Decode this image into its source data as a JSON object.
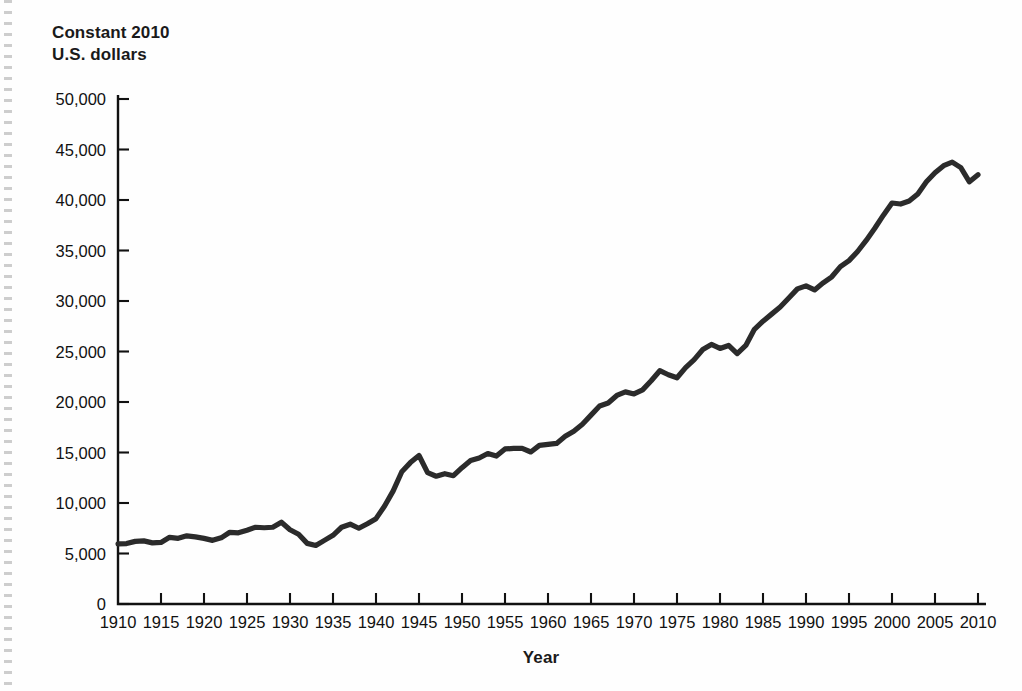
{
  "chart_data": {
    "type": "line",
    "title": "",
    "ylabel": "Constant 2010\nU.S. dollars",
    "xlabel": "Year",
    "xlim": [
      1910,
      2010
    ],
    "ylim": [
      0,
      50000
    ],
    "grid": false,
    "legend": "none",
    "yticks": [
      0,
      5000,
      10000,
      15000,
      20000,
      25000,
      30000,
      35000,
      40000,
      45000,
      50000
    ],
    "ytick_labels": [
      "0",
      "5,000",
      "10,000",
      "15,000",
      "20,000",
      "25,000",
      "30,000",
      "35,000",
      "40,000",
      "45,000",
      "50,000"
    ],
    "xticks": [
      1910,
      1915,
      1920,
      1925,
      1930,
      1935,
      1940,
      1945,
      1950,
      1955,
      1960,
      1965,
      1970,
      1975,
      1980,
      1985,
      1990,
      1995,
      2000,
      2005,
      2010
    ],
    "xtick_labels": [
      "1910",
      "1915",
      "1920",
      "1925",
      "1930",
      "1935",
      "1940",
      "1945",
      "1950",
      "1955",
      "1960",
      "1965",
      "1970",
      "1975",
      "1980",
      "1985",
      "1990",
      "1995",
      "2000",
      "2005",
      "2010"
    ],
    "line_color": "#2b2b2b",
    "series": [
      {
        "name": "Constant 2010 U.S. dollars",
        "x": [
          1910,
          1911,
          1912,
          1913,
          1914,
          1915,
          1916,
          1917,
          1918,
          1919,
          1920,
          1921,
          1922,
          1923,
          1924,
          1925,
          1926,
          1927,
          1928,
          1929,
          1930,
          1931,
          1932,
          1933,
          1934,
          1935,
          1936,
          1937,
          1938,
          1939,
          1940,
          1941,
          1942,
          1943,
          1944,
          1945,
          1946,
          1947,
          1948,
          1949,
          1950,
          1951,
          1952,
          1953,
          1954,
          1955,
          1956,
          1957,
          1958,
          1959,
          1960,
          1961,
          1962,
          1963,
          1964,
          1965,
          1966,
          1967,
          1968,
          1969,
          1970,
          1971,
          1972,
          1973,
          1974,
          1975,
          1976,
          1977,
          1978,
          1979,
          1980,
          1981,
          1982,
          1983,
          1984,
          1985,
          1986,
          1987,
          1988,
          1989,
          1990,
          1991,
          1992,
          1993,
          1994,
          1995,
          1996,
          1997,
          1998,
          1999,
          2000,
          2001,
          2002,
          2003,
          2004,
          2005,
          2006,
          2007,
          2008,
          2009,
          2010
        ],
        "values": [
          5950,
          5980,
          6200,
          6250,
          6050,
          6100,
          6600,
          6500,
          6750,
          6650,
          6500,
          6300,
          6550,
          7100,
          7050,
          7300,
          7600,
          7550,
          7600,
          8100,
          7350,
          6900,
          6000,
          5800,
          6300,
          6800,
          7600,
          7900,
          7500,
          7950,
          8450,
          9700,
          11200,
          13100,
          14000,
          14700,
          13000,
          12650,
          12900,
          12700,
          13500,
          14200,
          14450,
          14900,
          14650,
          15350,
          15400,
          15400,
          15050,
          15700,
          15800,
          15900,
          16600,
          17100,
          17800,
          18700,
          19600,
          19900,
          20650,
          21000,
          20800,
          21200,
          22100,
          23100,
          22700,
          22400,
          23400,
          24200,
          25200,
          25700,
          25300,
          25600,
          24800,
          25600,
          27200,
          28000,
          28700,
          29400,
          30300,
          31200,
          31500,
          31100,
          31800,
          32400,
          33400,
          34000,
          34900,
          36000,
          37200,
          38500,
          39700,
          39600,
          39900,
          40600,
          41800,
          42700,
          43400,
          43750,
          43200,
          41800,
          42500
        ],
        "units": "constant 2010 U.S. dollars"
      }
    ]
  },
  "figure": {
    "y_axis_title": "Constant 2010\nU.S. dollars",
    "x_axis_title": "Year"
  }
}
